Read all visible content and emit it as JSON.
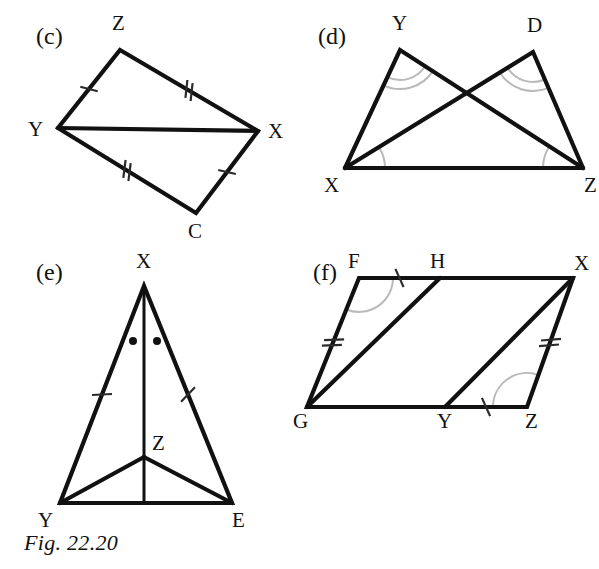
{
  "figure": {
    "caption": "Fig. 22.20",
    "background_color": "#ffffff",
    "ink_color": "#111111",
    "arc_color": "#b9b9b9"
  },
  "panels": [
    {
      "id": "c",
      "label": "(c)",
      "label_pos": {
        "x": 36,
        "y": 44
      },
      "shape": "quadrilateral-with-diagonal",
      "description": "Quadrilateral Z X C Y with diagonal Y X",
      "vertices": [
        {
          "name": "Z",
          "x": 120,
          "y": 50,
          "label_x": 112,
          "label_y": 30
        },
        {
          "name": "X",
          "x": 258,
          "y": 131,
          "label_x": 268,
          "label_y": 138
        },
        {
          "name": "C",
          "x": 196,
          "y": 213,
          "label_x": 188,
          "label_y": 238
        },
        {
          "name": "Y",
          "x": 58,
          "y": 128,
          "label_x": 28,
          "label_y": 136
        }
      ],
      "edges": [
        {
          "from": "Z",
          "to": "X",
          "ticks": 2
        },
        {
          "from": "X",
          "to": "C",
          "ticks": 1
        },
        {
          "from": "C",
          "to": "Y",
          "ticks": 2
        },
        {
          "from": "Y",
          "to": "Z",
          "ticks": 1
        },
        {
          "from": "Y",
          "to": "X",
          "ticks": 0
        }
      ],
      "arcs": []
    },
    {
      "id": "d",
      "label": "(d)",
      "label_pos": {
        "x": 318,
        "y": 44
      },
      "shape": "two-overlapping-triangles",
      "description": "Triangles X Y Z and X D Z on common base X Z, crossing above",
      "vertices": [
        {
          "name": "Y",
          "x": 400,
          "y": 50,
          "label_x": 392,
          "label_y": 30
        },
        {
          "name": "D",
          "x": 533,
          "y": 52,
          "label_x": 527,
          "label_y": 32
        },
        {
          "name": "X",
          "x": 345,
          "y": 168,
          "label_x": 324,
          "label_y": 192
        },
        {
          "name": "Z",
          "x": 583,
          "y": 168,
          "label_x": 584,
          "label_y": 192
        }
      ],
      "edges": [
        {
          "from": "X",
          "to": "Y",
          "ticks": 0
        },
        {
          "from": "Y",
          "to": "Z",
          "ticks": 0
        },
        {
          "from": "X",
          "to": "D",
          "ticks": 0
        },
        {
          "from": "D",
          "to": "Z",
          "ticks": 0
        },
        {
          "from": "X",
          "to": "Z",
          "ticks": 0
        }
      ],
      "arcs": [
        {
          "at": "Y",
          "count": 2
        },
        {
          "at": "D",
          "count": 2
        },
        {
          "at": "X",
          "count": 1
        },
        {
          "at": "Z",
          "count": 1
        }
      ]
    },
    {
      "id": "e",
      "label": "(e)",
      "label_pos": {
        "x": 36,
        "y": 280
      },
      "shape": "triangle-with-interior-point",
      "description": "Triangle X Y E with interior point Z, cevian X to base through Z, and segments Z Y and Z E",
      "vertices": [
        {
          "name": "X",
          "x": 144,
          "y": 286,
          "label_x": 136,
          "label_y": 268
        },
        {
          "name": "Z",
          "x": 144,
          "y": 457,
          "label_x": 152,
          "label_y": 450
        },
        {
          "name": "Y",
          "x": 60,
          "y": 503,
          "label_x": 38,
          "label_y": 527
        },
        {
          "name": "E",
          "x": 232,
          "y": 503,
          "label_x": 232,
          "label_y": 527
        }
      ],
      "edges": [
        {
          "from": "X",
          "to": "Y",
          "ticks": 1
        },
        {
          "from": "X",
          "to": "E",
          "ticks": 1
        },
        {
          "from": "Y",
          "to": "E",
          "ticks": 0
        },
        {
          "from": "Z",
          "to": "Y",
          "ticks": 0
        },
        {
          "from": "Z",
          "to": "E",
          "ticks": 0
        },
        {
          "from": "X",
          "to": "base",
          "ticks": 0
        }
      ],
      "arcs": [],
      "dots": [
        {
          "x": 133,
          "y": 341
        },
        {
          "x": 157,
          "y": 341
        }
      ]
    },
    {
      "id": "f",
      "label": "(f)",
      "label_pos": {
        "x": 313,
        "y": 280
      },
      "shape": "parallelogram-with-two-cevians",
      "description": "Parallelogram F X Z G with H on F X and Y on G Z, segments G H and Y X",
      "vertices": [
        {
          "name": "F",
          "x": 359,
          "y": 278,
          "label_x": 348,
          "label_y": 268
        },
        {
          "name": "H",
          "x": 440,
          "y": 278,
          "label_x": 430,
          "label_y": 268
        },
        {
          "name": "X",
          "x": 573,
          "y": 278,
          "label_x": 574,
          "label_y": 270
        },
        {
          "name": "G",
          "x": 307,
          "y": 407,
          "label_x": 293,
          "label_y": 428
        },
        {
          "name": "Y",
          "x": 445,
          "y": 407,
          "label_x": 437,
          "label_y": 428
        },
        {
          "name": "Z",
          "x": 527,
          "y": 407,
          "label_x": 525,
          "label_y": 428
        }
      ],
      "edges": [
        {
          "from": "F",
          "to": "H",
          "ticks": 1
        },
        {
          "from": "H",
          "to": "X",
          "ticks": 0
        },
        {
          "from": "X",
          "to": "Z",
          "ticks": 2
        },
        {
          "from": "Z",
          "to": "Y",
          "ticks": 0
        },
        {
          "from": "Y",
          "to": "G",
          "ticks": 0
        },
        {
          "from": "G",
          "to": "F",
          "ticks": 2
        },
        {
          "from": "G",
          "to": "H",
          "ticks": 0
        },
        {
          "from": "Y",
          "to": "X",
          "ticks": 0
        },
        {
          "from": "Y",
          "to": "Z",
          "ticks": 1
        }
      ],
      "arcs": [
        {
          "at": "F",
          "count": 1
        },
        {
          "at": "Z",
          "count": 1
        }
      ]
    }
  ]
}
